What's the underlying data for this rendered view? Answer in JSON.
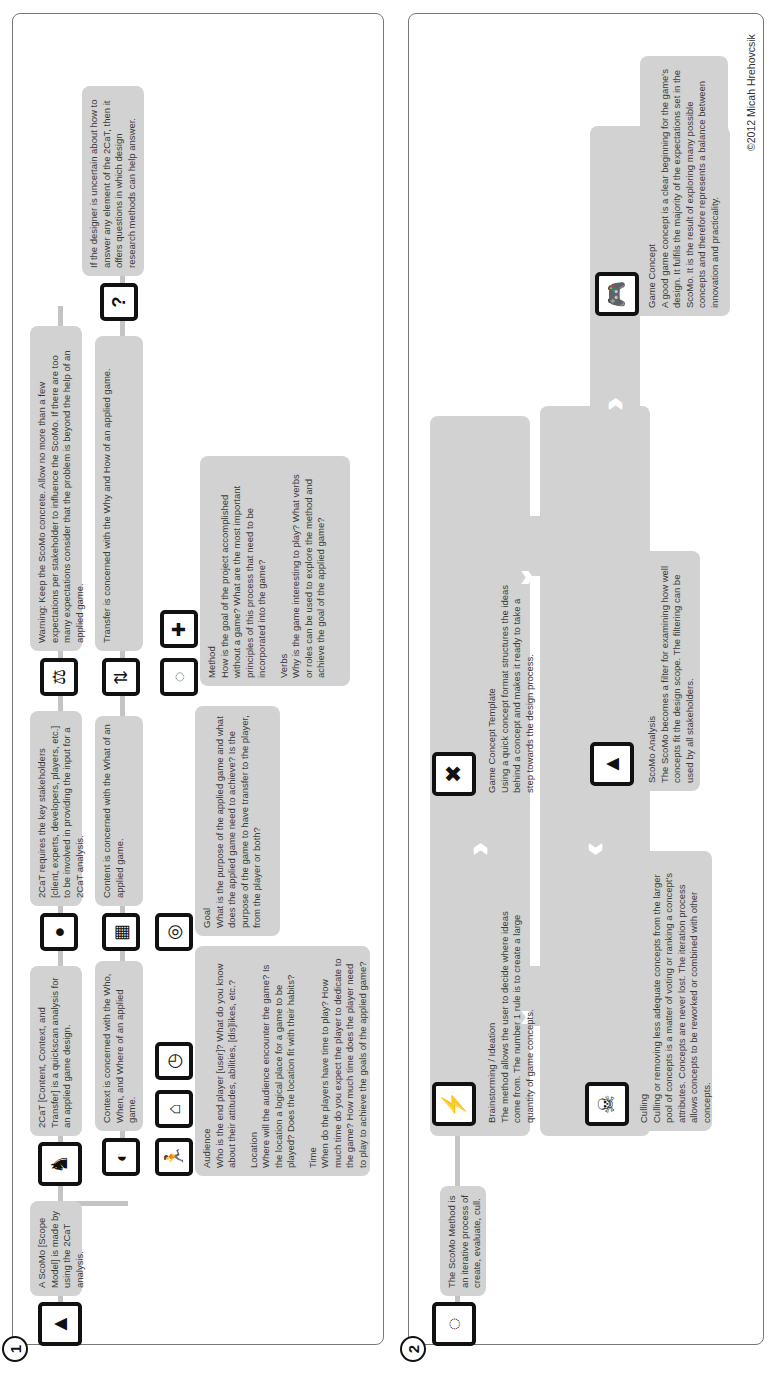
{
  "section1": {
    "number": "1",
    "intro": "A ScoMo [Scope Model] is made by using the 2CaT analysis.",
    "twocat": "2CaT [Content, Context, and Transfer] is a quickscan analysis for an applied game design.",
    "stakeholders": "2CaT requires the key stakeholders [client, experts, developers, players, etc.] to be involved in providing the input for a 2CaT analysis.",
    "warning": "Warning: Keep the ScoMo concrete. Allow no more than a few expectations per stakeholder to influence the ScoMo. If there are too many expectations consider that the problem is beyond the help of an applied game.",
    "uncertain": "If the designer is uncertain about how to answer any element of the 2CaT, then it offers questions in which design research methods can help answer.",
    "context": "Context is concerned with the Who, When, and Where of an applied game.",
    "content": "Content is concerned with the What of an applied game.",
    "transfer": "Transfer is concerned with the Why and How of an applied game.",
    "context_details": [
      {
        "title": "Audience",
        "text": "Who is the end player [user]? What do you know about their attitudes, abilities, [dis]likes, etc.?"
      },
      {
        "title": "Location",
        "text": "Where will the audience encounter the game? Is the location a logical place for a game to be played? Does the location fit with their habits?"
      },
      {
        "title": "Time",
        "text": "When do the players have time to play? How much time do you expect the player to dedicate to the game? How much time does the player need to play to achieve the goals of the applied game?"
      }
    ],
    "content_details": [
      {
        "title": "Goal",
        "text": "What is the purpose of the applied game and what does the applied game need to achieve? Is the purpose of the game to have transfer to the player, from the player or both?"
      }
    ],
    "transfer_details": [
      {
        "title": "Method",
        "text": "How is the goal of the project accomplished without a game? What are the most important principles of this process that need to be incorporated into the game?"
      },
      {
        "title": "Verbs",
        "text": "Why is the game interesting to play? What verbs or roles can be used to explore the method and achieve the goal of the applied game?"
      }
    ],
    "icons": [
      "triforce-icon",
      "stakeholders-icon",
      "head-icon",
      "scale-icon",
      "question-icon",
      "globe-icon",
      "chip-icon",
      "transfer-arrows-icon",
      "running-man-icon",
      "house-icon",
      "clock-icon",
      "target-icon",
      "cycle-icon",
      "puzzle-icon"
    ]
  },
  "section2": {
    "number": "2",
    "intro": "The ScoMo Method is an iterative process of create, evaluate, cull.",
    "steps": [
      {
        "title": "Brainstorming / Ideation",
        "text": "The method allows the user to decide where ideas come from. The number 1 rule is to create a large quantity of game concepts.",
        "icon": "brain-lightning-icon"
      },
      {
        "title": "Culling",
        "text": "Culling or removing less adequate concepts from the larger pool of concepts is a matter of voting or ranking a concept's attributes. Concepts are never lost. The iteration process allows concepts to be reworked or combined with other concepts.",
        "icon": "skull-bones-icon"
      },
      {
        "title": "Game Concept Template",
        "text": "Using a quick concept format structures the ideas behind a concept and makes it ready to take a step towards the design process.",
        "icon": "tools-icon"
      },
      {
        "title": "ScoMo Analysis",
        "text": "The ScoMo becomes a filter for examining how well concepts fit the design scope. The filtering can be used by all stakeholders.",
        "icon": "triforce-icon"
      },
      {
        "title": "Game Concept",
        "text": "A good game concept is a clear beginning for the game's design. It fulfils the majority of the expectations set in the ScoMo. It is the result of exploring many possible concepts and therefore represents a balance between innovation and practicality.",
        "icon": "gamepad-icon"
      }
    ]
  },
  "footer": {
    "copyright": "©2012 Micah Hrehovcsik"
  }
}
